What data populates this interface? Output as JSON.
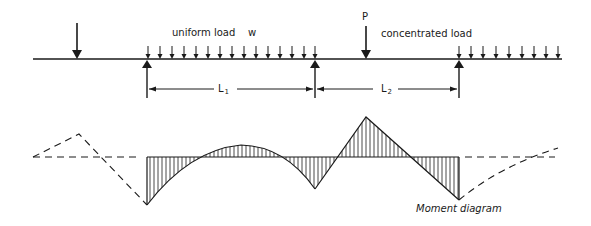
{
  "diagram": {
    "type": "continuous beam with loads and moment diagram",
    "labels": {
      "uniform_load": "uniform load",
      "uniform_load_symbol": "w",
      "concentrated_symbol": "P",
      "concentrated_load": "concentrated load",
      "span1_main": "L",
      "span1_sub": "1",
      "span2_main": "L",
      "span2_sub": "2",
      "moment_caption": "Moment diagram"
    },
    "beam": {
      "y": 59,
      "x_start": 33,
      "x_end": 562
    },
    "supports_x": [
      147,
      315,
      459
    ],
    "concentrated_load_x": 366,
    "left_point_load_x": 77,
    "moment_baseline_y": 157,
    "colors": {
      "ink": "#1a1a1a",
      "background": "#ffffff"
    }
  }
}
